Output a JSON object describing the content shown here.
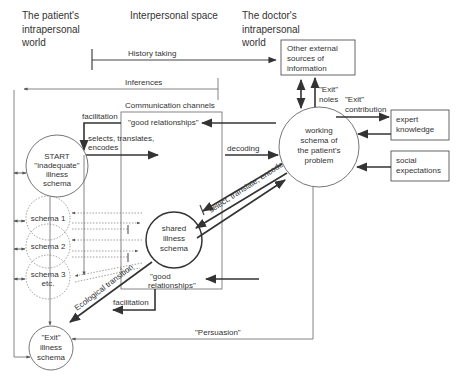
{
  "headers": {
    "patient_world": [
      "The patient's",
      "intrapersonal",
      "world"
    ],
    "interpersonal": "Interpersonal space",
    "doctor_world": [
      "The doctor's",
      "intrapersonal",
      "world"
    ]
  },
  "arrows": {
    "history_taking": "History taking",
    "inferences": "Inferences",
    "communication_channels": "Communication channels",
    "facilitation_top": "facilitation",
    "good_relationships_top": "\"good relationships\"",
    "selects_line1": "selects, translates,",
    "selects_line2": "encodes",
    "decoding": "decoding",
    "select_translate_encode": "select, translate, encode",
    "exit_roles_1": "\"Exit\"",
    "exit_roles_2": "noles",
    "exit_contribution_1": "\"Exit\"",
    "exit_contribution_2": "contribution",
    "good_relationships_bottom_1": "\"good",
    "good_relationships_bottom_2": "relationships\"",
    "facilitation_bottom": "facilitation",
    "ecological_transition": "Ecological transition",
    "persuasion": "\"Persuasion\""
  },
  "boxes": {
    "other_sources": [
      "Other external",
      "sources of",
      "information"
    ],
    "expert_knowledge": [
      "expert",
      "knowledge"
    ],
    "social_expectations": [
      "social",
      "expectations"
    ]
  },
  "nodes": {
    "start_schema": [
      "START",
      "\"inadequate\"",
      "illness",
      "schema"
    ],
    "schema1": "schema 1",
    "schema2": "schema 2",
    "schema3": [
      "schema 3",
      "etc."
    ],
    "shared_schema": [
      "shared",
      "illness",
      "schema"
    ],
    "working_schema": [
      "working",
      "schema of",
      "the patient's",
      "problem"
    ],
    "exit_schema": [
      "\"Exit\"",
      "illness",
      "schema"
    ]
  }
}
